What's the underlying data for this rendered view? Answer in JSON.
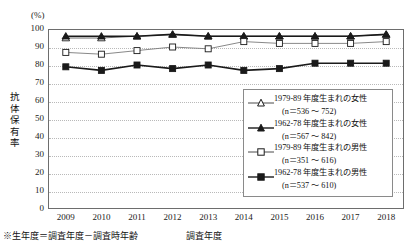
{
  "axis": {
    "unit_label": "(%)",
    "y_title_chars": [
      "抗",
      "体",
      "保",
      "有",
      "率"
    ],
    "x_title": "調査年度",
    "y_ticks": [
      "100",
      "90",
      "80",
      "70",
      "60",
      "50",
      "40",
      "30",
      "20",
      "10",
      "0"
    ],
    "x_ticks": [
      "2009",
      "2010",
      "2011",
      "2012",
      "2013",
      "2014",
      "2015",
      "2016",
      "2017",
      "2018"
    ]
  },
  "footnote": "※生年度＝調査年度－調査時年齢",
  "legend": {
    "items": [
      {
        "marker": "open-triangle-icon",
        "label": "1979-89 年度生まれの女性",
        "sub": "(n＝536 ～ 752)"
      },
      {
        "marker": "filled-triangle-icon",
        "label": "1962-78 年度生まれの女性",
        "sub": "(n＝567 ～ 842)"
      },
      {
        "marker": "open-square-icon",
        "label": "1979-89 年度生まれの男性",
        "sub": "(n＝351 ～ 616)"
      },
      {
        "marker": "filled-square-icon",
        "label": "1962-78 年度生まれの男性",
        "sub": "(n＝537 ～ 610)"
      }
    ]
  },
  "colors": {
    "line": "#1a1a1a",
    "line_light": "#7a7a7a",
    "grid": "#b9b9b9",
    "frame": "#6d6d6d",
    "background": "#ffffff"
  },
  "chart_data": {
    "type": "line",
    "title": "",
    "xlabel": "調査年度",
    "ylabel": "抗体保有率",
    "unit": "%",
    "ylim": [
      0,
      100
    ],
    "ytick_step": 10,
    "grid": true,
    "legend_position": "inside-right",
    "x": [
      "2009",
      "2010",
      "2011",
      "2012",
      "2013",
      "2014",
      "2015",
      "2016",
      "2017",
      "2018"
    ],
    "series": [
      {
        "name": "1979-89 年度生まれの女性",
        "marker": "open-triangle",
        "n_range": "536 ～ 752",
        "values": [
          95,
          95,
          96,
          97,
          96,
          96,
          96,
          96,
          96,
          97
        ]
      },
      {
        "name": "1962-78 年度生まれの女性",
        "marker": "filled-triangle",
        "n_range": "567 ～ 842",
        "values": [
          96,
          96,
          96,
          97,
          96,
          96,
          96,
          96,
          96,
          97
        ]
      },
      {
        "name": "1979-89 年度生まれの男性",
        "marker": "open-square",
        "n_range": "351 ～ 616",
        "values": [
          87,
          86,
          88,
          90,
          89,
          93,
          92,
          92,
          92,
          93
        ]
      },
      {
        "name": "1962-78 年度生まれの男性",
        "marker": "filled-square",
        "n_range": "537 ～ 610",
        "values": [
          79,
          77,
          80,
          78,
          80,
          77,
          78,
          81,
          81,
          81
        ]
      }
    ]
  }
}
